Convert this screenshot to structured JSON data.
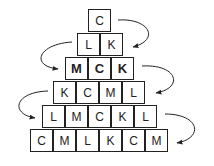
{
  "rows": [
    {
      "letters": [
        "C"
      ],
      "bold": false
    },
    {
      "letters": [
        "L",
        "K"
      ],
      "bold": false
    },
    {
      "letters": [
        "M",
        "C",
        "K"
      ],
      "bold": true
    },
    {
      "letters": [
        "K",
        "C",
        "M",
        "L"
      ],
      "bold": false
    },
    {
      "letters": [
        "L",
        "M",
        "C",
        "K",
        "L"
      ],
      "bold": false
    },
    {
      "letters": [
        "C",
        "M",
        "L",
        "K",
        "C",
        "M"
      ],
      "bold": false
    }
  ],
  "arrows": [
    {
      "from_row": 0,
      "to_row": 1,
      "side": "right"
    },
    {
      "from_row": 1,
      "to_row": 2,
      "side": "left"
    },
    {
      "from_row": 2,
      "to_row": 3,
      "side": "right"
    },
    {
      "from_row": 3,
      "to_row": 4,
      "side": "left"
    },
    {
      "from_row": 4,
      "to_row": 5,
      "side": "right"
    }
  ]
}
